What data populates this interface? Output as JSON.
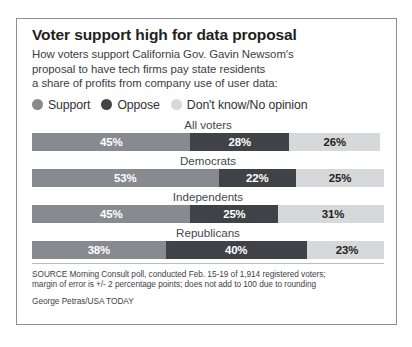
{
  "graphic": {
    "headline": "Voter support high for data proposal",
    "subhead_lines": [
      "How voters support California Gov. Gavin Newsom's",
      "proposal to have tech firms pay state residents",
      "a share of profits from company use of user data:"
    ],
    "source_lines": [
      "SOURCE Morning Consult poll, conducted Feb. 15-19 of 1,914 registered voters;",
      "margin of error is +/- 2 percentage points; does not add to 100 due to rounding"
    ],
    "byline": "George Petras/USA TODAY"
  },
  "legend": [
    {
      "label": "Support",
      "color": "#878a8f",
      "icon": "legend-dot-support"
    },
    {
      "label": "Oppose",
      "color": "#3f4246",
      "icon": "legend-dot-oppose"
    },
    {
      "label": "Don't know/No opinion",
      "color": "#d6d8da",
      "icon": "legend-dot-dontknow"
    }
  ],
  "chart_data": {
    "type": "bar",
    "subtype": "stacked-horizontal-100",
    "title": "Voter support high for data proposal",
    "subtitle": "How voters support California Gov. Gavin Newsom's proposal to have tech firms pay state residents a share of profits from company use of user data:",
    "xlabel": "",
    "ylabel": "",
    "xlim": [
      0,
      100
    ],
    "grid": false,
    "legend_position": "top",
    "categories": [
      "All voters",
      "Democrats",
      "Independents",
      "Republicans"
    ],
    "series": [
      {
        "name": "Support",
        "color": "#878a8f",
        "values": [
          45,
          53,
          45,
          38
        ],
        "labels": [
          "45%",
          "53%",
          "45%",
          "38%"
        ]
      },
      {
        "name": "Oppose",
        "color": "#3f4246",
        "values": [
          28,
          22,
          25,
          40
        ],
        "labels": [
          "28%",
          "22%",
          "25%",
          "40%"
        ]
      },
      {
        "name": "Don't know/No opinion",
        "color": "#d6d8da",
        "values": [
          26,
          25,
          31,
          23
        ],
        "labels": [
          "26%",
          "25%",
          "31%",
          "23%"
        ]
      }
    ],
    "groups": [
      {
        "label": "All voters",
        "segments": [
          {
            "series": "Support",
            "value": 45,
            "label": "45%"
          },
          {
            "series": "Oppose",
            "value": 28,
            "label": "28%"
          },
          {
            "series": "Don't know/No opinion",
            "value": 26,
            "label": "26%"
          }
        ]
      },
      {
        "label": "Democrats",
        "segments": [
          {
            "series": "Support",
            "value": 53,
            "label": "53%"
          },
          {
            "series": "Oppose",
            "value": 22,
            "label": "22%"
          },
          {
            "series": "Don't know/No opinion",
            "value": 25,
            "label": "25%"
          }
        ]
      },
      {
        "label": "Independents",
        "segments": [
          {
            "series": "Support",
            "value": 45,
            "label": "45%"
          },
          {
            "series": "Oppose",
            "value": 25,
            "label": "25%"
          },
          {
            "series": "Don't know/No opinion",
            "value": 31,
            "label": "31%"
          }
        ]
      },
      {
        "label": "Republicans",
        "segments": [
          {
            "series": "Support",
            "value": 38,
            "label": "38%"
          },
          {
            "series": "Oppose",
            "value": 40,
            "label": "40%"
          },
          {
            "series": "Don't know/No opinion",
            "value": 23,
            "label": "23%"
          }
        ]
      }
    ],
    "source": "SOURCE Morning Consult poll, conducted Feb. 15-19 of 1,914 registered voters; margin of error is +/- 2 percentage points; does not add to 100 due to rounding",
    "credit": "George Petras/USA TODAY"
  },
  "colors": {
    "support": "#878a8f",
    "oppose": "#3f4246",
    "dontknow": "#d6d8da",
    "frame_border": "#8c9096",
    "headline_text": "#231f20",
    "body_text": "#3a3d42"
  }
}
